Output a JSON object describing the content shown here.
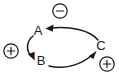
{
  "diagram": {
    "type": "regulatory-cycle-diagram",
    "background_color": "#ffffff",
    "stroke_color": "#1a1a1a",
    "nodes": [
      {
        "id": "A",
        "label": "A",
        "x": 38,
        "y": 32
      },
      {
        "id": "B",
        "label": "B",
        "x": 41,
        "y": 62
      },
      {
        "id": "C",
        "label": "C",
        "x": 101,
        "y": 47
      }
    ],
    "edges": [
      {
        "id": "a-to-b",
        "from": "A",
        "to": "B",
        "direction": "A to B"
      },
      {
        "id": "b-to-c",
        "from": "B",
        "to": "C",
        "direction": "B to C"
      },
      {
        "id": "c-to-a",
        "from": "C",
        "to": "A",
        "direction": "C to A"
      }
    ],
    "signs": [
      {
        "id": "sign-minus-top",
        "symbol": "−",
        "kind": "minus",
        "x": 60,
        "y": 11
      },
      {
        "id": "sign-plus-left",
        "symbol": "+",
        "kind": "plus",
        "x": 11,
        "y": 51
      },
      {
        "id": "sign-plus-right",
        "symbol": "+",
        "kind": "plus",
        "x": 107,
        "y": 64
      }
    ]
  }
}
